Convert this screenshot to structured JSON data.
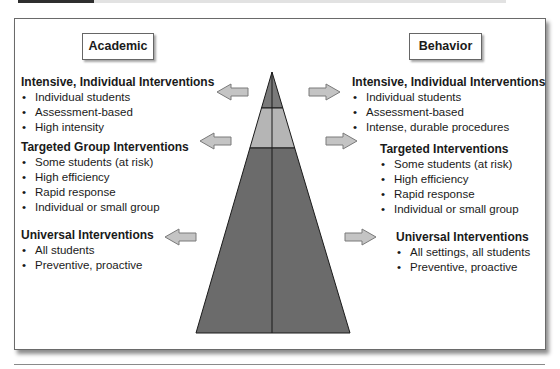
{
  "header": {
    "colors": {
      "dark_bar": "#2e2e2e",
      "light_bar": "#e2e2e2"
    }
  },
  "labels": {
    "academic": "Academic",
    "behavior": "Behavior"
  },
  "academic": {
    "intensive": {
      "title": "Intensive, Individual Interventions",
      "items": [
        "Individual students",
        "Assessment-based",
        "High intensity"
      ]
    },
    "targeted": {
      "title": "Targeted Group Interventions",
      "items": [
        "Some students (at risk)",
        "High efficiency",
        "Rapid response",
        "Individual or small group"
      ]
    },
    "universal": {
      "title": "Universal Interventions",
      "items": [
        "All students",
        "Preventive, proactive"
      ]
    }
  },
  "behavior": {
    "intensive": {
      "title": "Intensive, Individual Interventions",
      "items": [
        "Individual students",
        "Assessment-based",
        "Intense, durable procedures"
      ]
    },
    "targeted": {
      "title": "Targeted Interventions",
      "items": [
        "Some students (at risk)",
        "High efficiency",
        "Rapid response",
        "Individual or small group"
      ]
    },
    "universal": {
      "title": "Universal Interventions",
      "items": [
        "All settings, all students",
        "Preventive, proactive"
      ]
    }
  },
  "pyramid": {
    "tiers": [
      {
        "name": "intensive",
        "color": "#7a7a7a"
      },
      {
        "name": "targeted",
        "color": "#b5b5b5"
      },
      {
        "name": "universal",
        "color": "#6b6b6b"
      }
    ],
    "arrow_color": "#c4c4c4"
  }
}
